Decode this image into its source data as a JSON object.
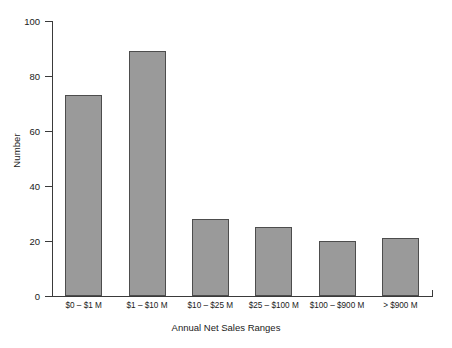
{
  "chart_data": {
    "type": "bar",
    "title": "",
    "xlabel": "Annual Net Sales Ranges",
    "ylabel": "Number",
    "categories": [
      "$0 – $1 M",
      "$1 – $10 M",
      "$10 – $25 M",
      "$25 – $100 M",
      "$100 – $900 M",
      "> $900 M"
    ],
    "values": [
      73,
      89,
      28,
      25,
      20,
      21
    ],
    "ylim": [
      0,
      100
    ],
    "yticks": [
      0,
      20,
      40,
      60,
      80,
      100
    ],
    "ytick_labels": [
      "0",
      "20",
      "40",
      "60",
      "80",
      "100"
    ],
    "grid": false,
    "legend": "none",
    "bar_color": "#9a9a9a",
    "bar_edge_color": "#4d4d4d",
    "axis_color": "#3a3a3a",
    "background": "#ffffff"
  }
}
